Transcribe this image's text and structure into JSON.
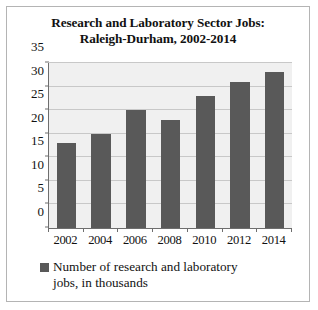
{
  "chart_data": {
    "type": "bar",
    "title": "Research and Laboratory Sector Jobs: Raleigh-Durham, 2002-2014",
    "title_line1": "Research and Laboratory Sector Jobs:",
    "title_line2": "Raleigh-Durham, 2002-2014",
    "categories": [
      "2002",
      "2004",
      "2006",
      "2008",
      "2010",
      "2012",
      "2014"
    ],
    "values": [
      18,
      20,
      25,
      23,
      28,
      31,
      33
    ],
    "series": [
      {
        "name": "Number of research and laboratory jobs, in thousands",
        "values": [
          18,
          20,
          25,
          23,
          28,
          31,
          33
        ]
      }
    ],
    "xlabel": "",
    "ylabel": "",
    "ylim": [
      0,
      35
    ],
    "ytick_values": [
      0,
      5,
      10,
      15,
      20,
      25,
      30,
      35
    ],
    "ytick_labels": [
      "0",
      "5",
      "10",
      "15",
      "20",
      "25",
      "30",
      "35"
    ],
    "grid": true,
    "legend_position": "bottom",
    "legend": [
      {
        "label_line1": "Number of research and laboratory",
        "label_line2": "jobs, in thousands",
        "label": "Number of research and laboratory jobs, in thousands",
        "color": "#595959"
      }
    ],
    "colors": {
      "bar": "#595959",
      "plot_background": "#f0f0f0",
      "gridline": "#c8c8c8",
      "axis": "#6e6e6e",
      "border": "#b4b4b4",
      "text": "#111111",
      "figure_background": "#ffffff"
    }
  }
}
